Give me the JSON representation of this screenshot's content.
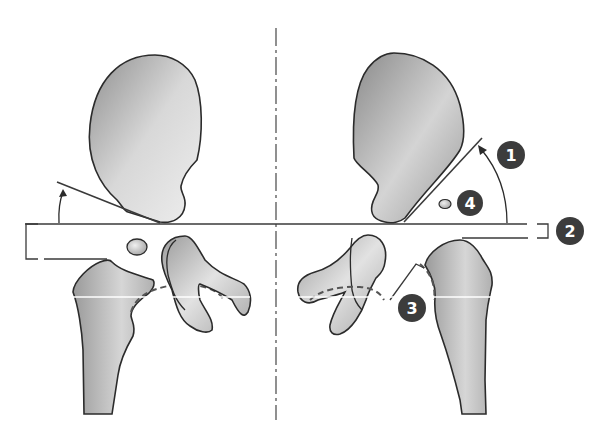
{
  "diagram": {
    "type": "anatomical-schematic",
    "colors": {
      "bone_fill_light": "#e6e6e6",
      "bone_fill_dark": "#9a9a9a",
      "outline": "#2b2b2b",
      "line": "#3a3a3a",
      "badge_fill": "#3c3c3c",
      "badge_text": "#ffffff",
      "background": "#ffffff"
    },
    "labels": [
      {
        "id": "1",
        "text": "1",
        "meaning": "angle between horizontal reference line and acetabular roof line (right side)"
      },
      {
        "id": "2",
        "text": "2",
        "meaning": "vertical distance bracket between horizontal reference line and top of femoral metaphysis"
      },
      {
        "id": "3",
        "text": "3",
        "meaning": "Shenton / Menard arc line at femoral neck and obturator foramen"
      },
      {
        "id": "4",
        "text": "4",
        "meaning": "femoral head ossification nucleus position"
      }
    ],
    "elements": {
      "midline": "vertical dash-dot symmetry axis",
      "horizontal_reference_line": "Hilgenreiner line through triradiate cartilage",
      "left_angle_arc": "arrow arc indicating acetabular angle (left side)",
      "right_angle_arc": "arrow arc indicating acetabular angle (right side)",
      "left_bracket": "distance bracket (left)",
      "right_bracket": "distance bracket (right)"
    }
  }
}
